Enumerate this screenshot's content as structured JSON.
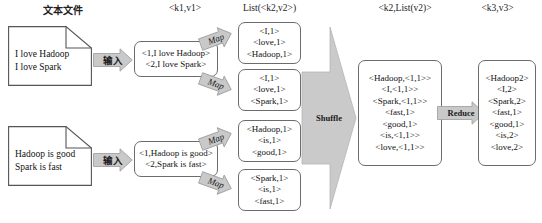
{
  "diagram": {
    "colors": {
      "arrow_fill": "#c9c9c9",
      "arrow_stroke": "#9a9a9a",
      "box_stroke": "#6c6c6c",
      "text": "#111111"
    },
    "headers": [
      {
        "name": "header-text-files",
        "text": "文本文件"
      },
      {
        "name": "header-k1v1",
        "text": "<k1,v1>"
      },
      {
        "name": "header-list-k2v2",
        "text": "List(<k2,v2>)"
      },
      {
        "name": "header-k2-listv2",
        "text": "<k2,List(v2)>"
      },
      {
        "name": "header-k3v3",
        "text": "<k3,v3>"
      }
    ],
    "documents": [
      {
        "name": "input-document-1",
        "lines": [
          "I love Hadoop",
          "I love Spark"
        ]
      },
      {
        "name": "input-document-2",
        "lines": [
          "Hadoop is good",
          "Spark is fast"
        ]
      }
    ],
    "input_arrows": [
      {
        "name": "input-arrow-1",
        "label": "输入"
      },
      {
        "name": "input-arrow-2",
        "label": "输入"
      }
    ],
    "split_boxes": [
      {
        "name": "split-box-1",
        "lines": [
          "<1,I love Hadoop>",
          "<2,I love Spark>"
        ]
      },
      {
        "name": "split-box-2",
        "lines": [
          "<1,Hadoop is good>",
          "<2,Spark is fast>"
        ]
      }
    ],
    "map_arrows": [
      {
        "name": "map-arrow-1",
        "label": "Map"
      },
      {
        "name": "map-arrow-2",
        "label": "Map"
      },
      {
        "name": "map-arrow-3",
        "label": "Map"
      },
      {
        "name": "map-arrow-4",
        "label": "Map"
      }
    ],
    "map_output_boxes": [
      {
        "name": "map-output-box-1",
        "lines": [
          "<I,1>",
          "<love,1>",
          "<Hadoop,1>"
        ]
      },
      {
        "name": "map-output-box-2",
        "lines": [
          "<I,1>",
          "<love,1>",
          "<Spark,1>"
        ]
      },
      {
        "name": "map-output-box-3",
        "lines": [
          "<Hadoop,1>",
          "<is,1>",
          "<good,1>"
        ]
      },
      {
        "name": "map-output-box-4",
        "lines": [
          "<Spark,1>",
          "<is,1>",
          "<fast,1>"
        ]
      }
    ],
    "shuffle_arrow": {
      "name": "shuffle-arrow",
      "label": "Shuffle"
    },
    "shuffle_output_box": {
      "name": "shuffle-output-box",
      "lines": [
        "<Hadoop,<1,1>>",
        "<I,<1,1>>",
        "<Spark,<1,1>>",
        "<fast,1>",
        "<good,1>",
        "<is,<1,1>>",
        "<love,<1,1>>"
      ]
    },
    "reduce_arrow": {
      "name": "reduce-arrow",
      "label": "Reduce"
    },
    "reduce_output_box": {
      "name": "reduce-output-box",
      "lines": [
        "<Hadoop2>",
        "<I,2>",
        "<Spark,2>",
        "<fast,1>",
        "<good,1>",
        "<is,2>",
        "<love,2>"
      ]
    }
  }
}
